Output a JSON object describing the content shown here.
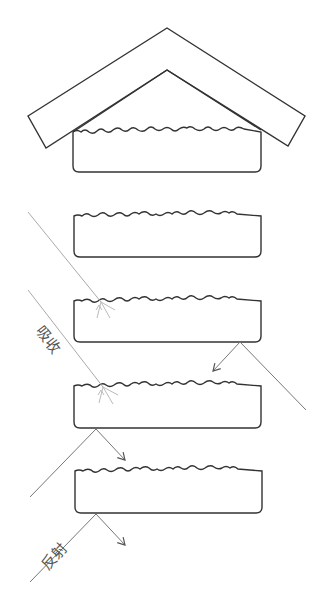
{
  "diagram": {
    "labels": {
      "absorb": "吸收",
      "reflect": "反射"
    },
    "colors": {
      "stroke": "#333333",
      "ray": "#777777",
      "ray_light": "#aaaaaa",
      "background": "#ffffff"
    },
    "slabs": [
      {
        "id": "slab-1",
        "top": 131,
        "bottom": 172
      },
      {
        "id": "slab-2",
        "top": 215,
        "bottom": 257
      },
      {
        "id": "slab-3",
        "top": 300,
        "bottom": 342
      },
      {
        "id": "slab-4",
        "top": 385,
        "bottom": 428
      },
      {
        "id": "slab-5",
        "top": 470,
        "bottom": 513
      }
    ]
  }
}
